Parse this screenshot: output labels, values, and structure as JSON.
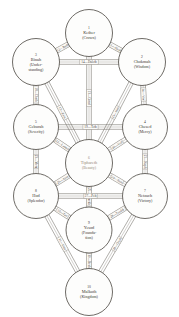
{
  "diagram": {
    "background_color": "#ffffff",
    "line_color": "#6e6a63",
    "text_color": "#3a3731",
    "accent_color": "#9a8a7a"
  },
  "sephirot": [
    {
      "number": "1",
      "name": "Kether",
      "gloss": "(Crown)",
      "cx": 89,
      "cy": 33,
      "r": 23.5,
      "accent": false
    },
    {
      "number": "2",
      "name": "Chokmah",
      "gloss": "(Wisdom)",
      "cx": 142,
      "cy": 62,
      "r": 23.5,
      "accent": false
    },
    {
      "number": "3",
      "name": "Binah",
      "gloss": "(Under-standing)",
      "cx": 36,
      "cy": 62,
      "r": 23.5,
      "accent": false
    },
    {
      "number": "4",
      "name": "Chesed",
      "gloss": "(Mercy)",
      "cx": 145,
      "cy": 127,
      "r": 22.5,
      "accent": false
    },
    {
      "number": "5",
      "name": "Geburah",
      "gloss": "(Severity)",
      "cx": 36,
      "cy": 127,
      "r": 22.5,
      "accent": false
    },
    {
      "number": "6",
      "name": "Tiphareth",
      "gloss": "(Beauty)",
      "cx": 89,
      "cy": 163,
      "r": 23.5,
      "accent": true
    },
    {
      "number": "7",
      "name": "Netzach",
      "gloss": "(Victory)",
      "cx": 145,
      "cy": 196,
      "r": 22.5,
      "accent": false
    },
    {
      "number": "8",
      "name": "Hod",
      "gloss": "(Splendor)",
      "cx": 36,
      "cy": 196,
      "r": 22.5,
      "accent": false
    },
    {
      "number": "9",
      "name": "Yesod",
      "gloss": "(Founda-tion)",
      "cx": 89,
      "cy": 230,
      "r": 23.0,
      "accent": false
    },
    {
      "number": "10",
      "name": "Malkuth",
      "gloss": "(Kingdom)",
      "cx": 89,
      "cy": 292,
      "r": 23.5,
      "accent": false
    }
  ],
  "paths": [
    {
      "id": "11",
      "label": "11—Aleph",
      "from": 1,
      "to": 2
    },
    {
      "id": "12",
      "label": "12—Beth",
      "from": 1,
      "to": 3
    },
    {
      "id": "13",
      "label": "13—Gimel",
      "from": 1,
      "to": 6
    },
    {
      "id": "14",
      "label": "14—Daleth",
      "from": 3,
      "to": 2
    },
    {
      "id": "15",
      "label": "15—Heh",
      "from": 2,
      "to": 6
    },
    {
      "id": "16",
      "label": "16—Vav",
      "from": 2,
      "to": 4
    },
    {
      "id": "17",
      "label": "17—Zain",
      "from": 3,
      "to": 6
    },
    {
      "id": "18",
      "label": "18—Cheth",
      "from": 3,
      "to": 5
    },
    {
      "id": "19",
      "label": "19—Teth",
      "from": 5,
      "to": 4
    },
    {
      "id": "20",
      "label": "20—Yod",
      "from": 4,
      "to": 6
    },
    {
      "id": "21",
      "label": "21—Kaph",
      "from": 4,
      "to": 7
    },
    {
      "id": "22",
      "label": "22—Lamed",
      "from": 5,
      "to": 6
    },
    {
      "id": "23",
      "label": "23—Mem",
      "from": 5,
      "to": 8
    },
    {
      "id": "24",
      "label": "24—Nun",
      "from": 6,
      "to": 7
    },
    {
      "id": "25",
      "label": "25—Samekh",
      "from": 6,
      "to": 9
    },
    {
      "id": "26",
      "label": "26—Ayin",
      "from": 6,
      "to": 8
    },
    {
      "id": "27",
      "label": "27—Peh",
      "from": 8,
      "to": 7
    },
    {
      "id": "28",
      "label": "28—Tzaddi",
      "from": 7,
      "to": 9
    },
    {
      "id": "29",
      "label": "29—Qoph",
      "from": 7,
      "to": 10
    },
    {
      "id": "30",
      "label": "30—Resh",
      "from": 9,
      "to": 10
    },
    {
      "id": "31",
      "label": "31—Shin",
      "from": 8,
      "to": 10
    },
    {
      "id": "32",
      "label": "32—Tav",
      "from": 8,
      "to": 9
    }
  ]
}
